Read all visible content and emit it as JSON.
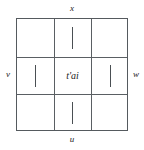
{
  "figure": {
    "type": "labeled-3x3-grid-diagram",
    "center": {
      "label": "t'ai"
    },
    "edge_labels": {
      "top": "x",
      "bottom": "u",
      "left": "v",
      "right": "w"
    },
    "colors": {
      "background": "#ffffff",
      "border": "#555a5e",
      "rule": "#5a5f63",
      "stroke": "#4a4f53",
      "text": "#232323"
    },
    "cells": [
      {
        "position": "top-left",
        "content": ""
      },
      {
        "position": "top-center",
        "content": "stroke"
      },
      {
        "position": "top-right",
        "content": ""
      },
      {
        "position": "middle-left",
        "content": "stroke"
      },
      {
        "position": "middle-center",
        "content": "t'ai"
      },
      {
        "position": "middle-right",
        "content": "stroke"
      },
      {
        "position": "bottom-left",
        "content": ""
      },
      {
        "position": "bottom-center",
        "content": "stroke"
      },
      {
        "position": "bottom-right",
        "content": ""
      }
    ]
  }
}
